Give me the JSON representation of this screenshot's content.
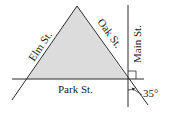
{
  "diagram": {
    "type": "street-map-geometry",
    "colors": {
      "line": "#2a2a2a",
      "triangle_fill": "#dcdcdc",
      "background": "#ffffff"
    },
    "streets": [
      {
        "id": "elm",
        "label": "Elm St."
      },
      {
        "id": "oak",
        "label": "Oak St."
      },
      {
        "id": "main",
        "label": "Main St."
      },
      {
        "id": "park",
        "label": "Park St."
      }
    ],
    "angle": {
      "label": "35°",
      "value_degrees": 35
    },
    "right_angle_marker": true,
    "shaded_region": "triangle formed by Elm St., Oak St., and Park St."
  }
}
